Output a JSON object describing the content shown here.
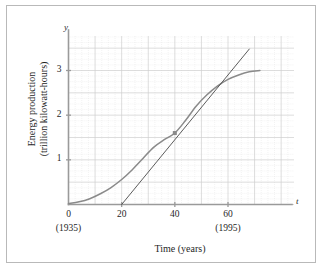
{
  "chart_data": {
    "type": "line",
    "title": "",
    "xlabel": "Time (years)",
    "ylabel": "Energy production (trillion kilowatt-hours)",
    "ylabel_line1": "Energy production",
    "ylabel_line2": "(trillion kilowatt-hours)",
    "x_axis_letter": "t",
    "y_axis_letter": "y",
    "xlim": [
      0,
      78
    ],
    "ylim": [
      0,
      3.75
    ],
    "xticks": [
      0,
      20,
      40,
      60
    ],
    "xtick_labels": [
      "0",
      "20",
      "40",
      "60"
    ],
    "yticks": [
      1,
      2,
      3
    ],
    "ytick_labels": [
      "1",
      "2",
      "3"
    ],
    "x_annotations": [
      {
        "x": 0,
        "label": "(1935)"
      },
      {
        "x": 60,
        "label": "(1995)"
      }
    ],
    "grid": true,
    "grid_minor_step_x": 2.5,
    "grid_minor_step_y": 0.125,
    "grid_major_step_x": 10,
    "grid_major_step_y": 0.5,
    "legend": null,
    "series": [
      {
        "name": "energy-production-curve",
        "type": "line",
        "color": "#8a8a8a",
        "points": [
          [
            0,
            0.02
          ],
          [
            4,
            0.06
          ],
          [
            8,
            0.13
          ],
          [
            12,
            0.24
          ],
          [
            16,
            0.38
          ],
          [
            20,
            0.56
          ],
          [
            24,
            0.78
          ],
          [
            28,
            1.03
          ],
          [
            32,
            1.28
          ],
          [
            36,
            1.45
          ],
          [
            40,
            1.6
          ],
          [
            44,
            1.88
          ],
          [
            48,
            2.2
          ],
          [
            52,
            2.45
          ],
          [
            56,
            2.65
          ],
          [
            60,
            2.8
          ],
          [
            64,
            2.9
          ],
          [
            68,
            2.97
          ],
          [
            72,
            3.0
          ]
        ]
      },
      {
        "name": "tangent-line",
        "type": "line",
        "color": "#4a4a4a",
        "points": [
          [
            20,
            0.0
          ],
          [
            68,
            3.48
          ]
        ]
      }
    ],
    "markers": [
      {
        "name": "inflection-point",
        "x": 40,
        "y": 1.6,
        "shape": "square",
        "color": "#8a8a8a"
      }
    ]
  },
  "colors": {
    "frame": "#b9b9b9",
    "axis": "#9a9a9a",
    "grid_minor": "#dedede",
    "grid_major": "#cfcfcf",
    "curve": "#8a8a8a",
    "tangent": "#4a4a4a",
    "text": "#1f1f1f",
    "background": "#ffffff"
  }
}
